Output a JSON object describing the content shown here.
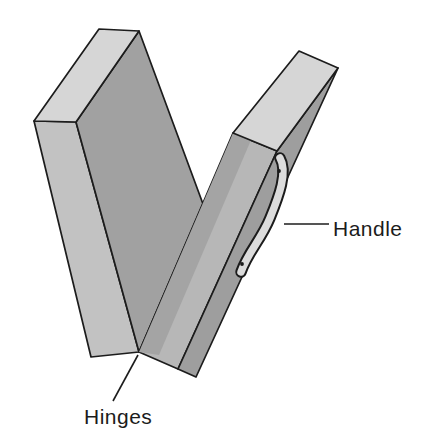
{
  "figure": {
    "type": "labeled-line-diagram",
    "labels": {
      "handle": "Handle",
      "hinges": "Hinges"
    }
  },
  "colors": {
    "background": "#ffffff",
    "outline": "#1c1c1c",
    "left_top_face": "#d6d6d6",
    "left_spine_face": "#c2c2c2",
    "left_inner_face": "#a1a1a1",
    "right_front_face": "#b7b7b7",
    "right_front_shadow": "#a4a4a4",
    "right_top_face": "#d6d6d6",
    "right_edge_face": "#9e9e9e",
    "handle_fill": "#dcdcdc",
    "handle_outline": "#1c1c1c",
    "leader_line": "#1c1c1c",
    "text": "#1c1c1c"
  }
}
